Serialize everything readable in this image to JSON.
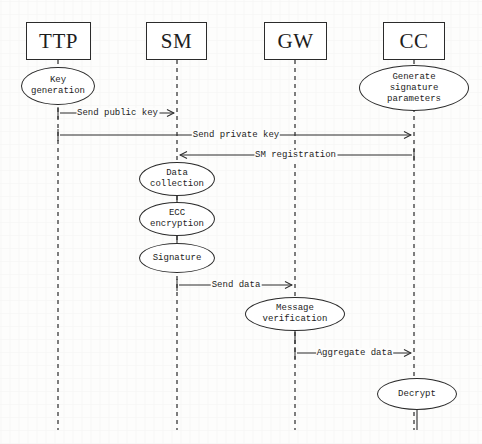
{
  "diagram": {
    "type": "sequence-diagram",
    "title": "",
    "width": 482,
    "height": 444,
    "colors": {
      "background": "#fdfdfc",
      "stroke": "#2b2b2b",
      "text": "#1d1d1d",
      "lifeline": "#3a3a3a"
    },
    "actors": [
      {
        "id": "ttp",
        "label": "TTP",
        "x": 26,
        "y": 22,
        "w": 65,
        "h": 38,
        "lifeline_x": 58,
        "lifeline_top": 60,
        "lifeline_bottom": 430
      },
      {
        "id": "sm",
        "label": "SM",
        "x": 146,
        "y": 22,
        "w": 61,
        "h": 38,
        "lifeline_x": 177,
        "lifeline_top": 60,
        "lifeline_bottom": 430
      },
      {
        "id": "gw",
        "label": "GW",
        "x": 264,
        "y": 22,
        "w": 63,
        "h": 38,
        "lifeline_x": 295,
        "lifeline_top": 60,
        "lifeline_bottom": 430
      },
      {
        "id": "cc",
        "label": "CC",
        "x": 383,
        "y": 22,
        "w": 62,
        "h": 38,
        "lifeline_x": 414,
        "lifeline_top": 60,
        "lifeline_bottom": 430
      }
    ],
    "activities": [
      {
        "id": "key-generation",
        "text": "Key\ngeneration",
        "cx": 58,
        "cy": 86,
        "rx": 37,
        "ry": 19
      },
      {
        "id": "generate-signature",
        "text": "Generate\nsignature\nparameters",
        "cx": 414,
        "cy": 88,
        "rx": 55,
        "ry": 23
      },
      {
        "id": "data-collection",
        "text": "Data\ncollection",
        "cx": 177,
        "cy": 179,
        "rx": 38,
        "ry": 17
      },
      {
        "id": "ecc-encryption",
        "text": "ECC\nencryption",
        "cx": 177,
        "cy": 219,
        "rx": 38,
        "ry": 17
      },
      {
        "id": "signature",
        "text": "Signature",
        "cx": 177,
        "cy": 258,
        "rx": 38,
        "ry": 15
      },
      {
        "id": "message-verification",
        "text": "Message\nverification",
        "cx": 295,
        "cy": 314,
        "rx": 50,
        "ry": 17
      },
      {
        "id": "decrypt",
        "text": "Decrypt",
        "cx": 417,
        "cy": 394,
        "rx": 40,
        "ry": 16
      }
    ],
    "messages": [
      {
        "id": "send-public-key",
        "label": "Send public key",
        "from": "ttp",
        "to": "sm",
        "from_x": 58,
        "to_x": 177,
        "y": 113,
        "direction": "right"
      },
      {
        "id": "send-private-key",
        "label": "Send private key",
        "from": "ttp",
        "to": "cc",
        "from_x": 58,
        "to_x": 414,
        "y": 135,
        "direction": "right"
      },
      {
        "id": "sm-registration",
        "label": "SM registration",
        "from": "cc",
        "to": "sm",
        "from_x": 414,
        "to_x": 177,
        "y": 155,
        "direction": "left"
      },
      {
        "id": "send-data",
        "label": "Send data",
        "from": "sm",
        "to": "gw",
        "from_x": 177,
        "to_x": 295,
        "y": 285,
        "direction": "right"
      },
      {
        "id": "aggregate-data",
        "label": "Aggregate data",
        "from": "gw",
        "to": "cc",
        "from_x": 295,
        "to_x": 414,
        "y": 353,
        "direction": "right"
      }
    ],
    "connectors": [
      {
        "id": "data-to-ecc",
        "x": 177,
        "y1": 196,
        "y2": 202
      },
      {
        "id": "ecc-to-signature",
        "x": 177,
        "y1": 236,
        "y2": 243
      },
      {
        "id": "verif-to-bottom",
        "x": 295,
        "y1": 331,
        "y2": 344
      },
      {
        "id": "decrypt-tail",
        "x": 417,
        "y1": 410,
        "y2": 430
      }
    ]
  }
}
